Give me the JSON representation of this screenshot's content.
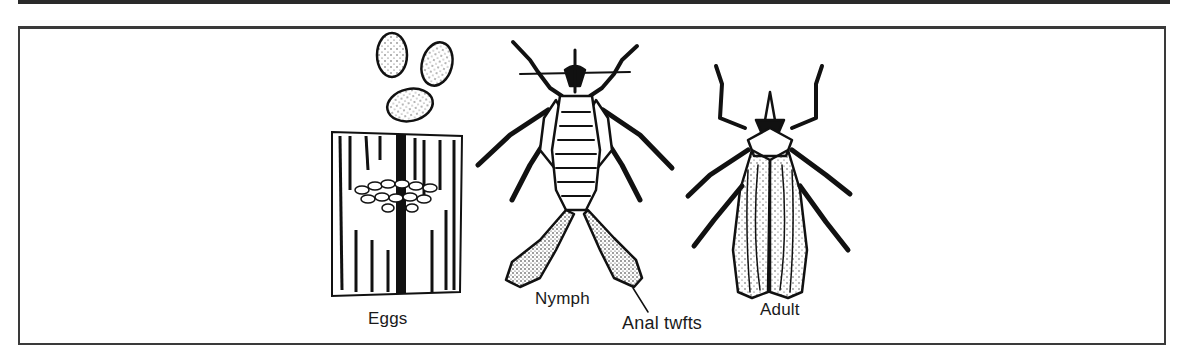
{
  "figure": {
    "type": "insect life cycle illustration",
    "stages": [
      {
        "id": "eggs",
        "label": "Eggs"
      },
      {
        "id": "nymph",
        "label": "Nymph"
      },
      {
        "id": "adult",
        "label": "Adult"
      }
    ],
    "annotations": [
      {
        "id": "anal-tufts",
        "label": "Anal twfts",
        "points_to": "nymph"
      }
    ],
    "colors": {
      "ink": "#1a1a1a",
      "paper": "#ffffff"
    }
  }
}
